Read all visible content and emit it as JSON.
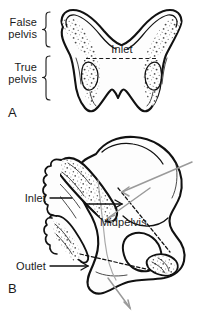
{
  "figure": {
    "background_color": "#ffffff",
    "ink_color": "#111111",
    "gray_arrow_color": "#9a9a9a"
  },
  "panel_a": {
    "letter": "A",
    "view": "anterior view of the bony pelvis",
    "labels": {
      "false_pelvis_line1": "False",
      "false_pelvis_line2": "pelvis",
      "true_pelvis_line1": "True",
      "true_pelvis_line2": "pelvis",
      "inlet": "Inlet"
    },
    "brackets": [
      {
        "name": "false-pelvis-bracket",
        "spans": "False pelvis"
      },
      {
        "name": "true-pelvis-bracket",
        "spans": "True pelvis"
      }
    ],
    "inlet_line_style": "dashed-horizontal"
  },
  "panel_b": {
    "letter": "B",
    "view": "lateral oblique view of the hemipelvis with sacrum",
    "labels": {
      "inlet": "Inlet",
      "midpelvis": "Midpelvis",
      "outlet": "Outlet"
    },
    "leader_lines": [
      {
        "name": "inlet-leader",
        "label": "Inlet",
        "style": "solid-arrow"
      },
      {
        "name": "midpelvis-leader",
        "label": "Midpelvis",
        "style": "gray-arrow"
      },
      {
        "name": "outlet-leader",
        "label": "Outlet",
        "style": "solid-arrow"
      }
    ],
    "planes": [
      {
        "name": "inlet-plane",
        "style": "dashed"
      },
      {
        "name": "midpelvis-plane",
        "style": "dashed"
      },
      {
        "name": "outlet-plane",
        "style": "dashed"
      }
    ],
    "direction_arrows": [
      {
        "name": "inlet-direction-arrow",
        "color": "#9a9a9a"
      },
      {
        "name": "outlet-direction-arrow",
        "color": "#9a9a9a"
      }
    ]
  }
}
